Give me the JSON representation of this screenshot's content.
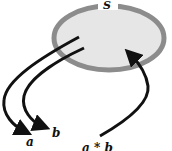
{
  "diagram": {
    "set_label": "S",
    "element_a_label": "a",
    "element_b_label": "b",
    "product_label": "a * b",
    "colors": {
      "set_fill": "#e6e6e6",
      "set_border": "#8c8c8c",
      "arrow": "#111111",
      "text": "#111111"
    },
    "arrows": [
      {
        "from": "S",
        "to": "a"
      },
      {
        "from": "S",
        "to": "b"
      },
      {
        "from": "a * b",
        "to": "S"
      }
    ]
  }
}
